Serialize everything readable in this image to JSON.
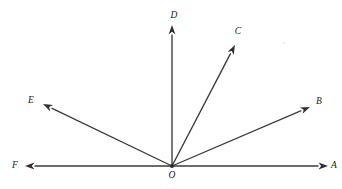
{
  "figure": {
    "background_color": "#ffffff",
    "line_color": "#3a3a3a",
    "arrow_color": "#2e2e2e",
    "label_color": "#1a1a1a",
    "width": 342,
    "height": 189
  },
  "vertex": {
    "label": "O",
    "x": 172,
    "y": 166,
    "label_x": 172,
    "label_y": 178
  },
  "rays": [
    {
      "label": "A",
      "name": "ray-oa",
      "from_x": 172,
      "from_y": 166,
      "to_x": 328,
      "to_y": 166,
      "angle_deg": 0,
      "label_x": 334,
      "label_y": 168
    },
    {
      "label": "B",
      "name": "ray-ob",
      "from_x": 172,
      "from_y": 166,
      "to_x": 310,
      "to_y": 107,
      "angle_deg": 23,
      "label_x": 319,
      "label_y": 104
    },
    {
      "label": "C",
      "name": "ray-oc",
      "from_x": 172,
      "from_y": 166,
      "to_x": 235,
      "to_y": 45,
      "angle_deg": 62,
      "label_x": 238,
      "label_y": 34
    },
    {
      "label": "D",
      "name": "ray-od",
      "from_x": 172,
      "from_y": 166,
      "to_x": 172,
      "to_y": 25,
      "angle_deg": 90,
      "label_x": 174,
      "label_y": 18
    },
    {
      "label": "E",
      "name": "ray-oe",
      "from_x": 172,
      "from_y": 166,
      "to_x": 43,
      "to_y": 104,
      "angle_deg": 154,
      "label_x": 31,
      "label_y": 103
    },
    {
      "label": "F",
      "name": "ray-of",
      "from_x": 172,
      "from_y": 166,
      "to_x": 25,
      "to_y": 166,
      "angle_deg": 180,
      "label_x": 15,
      "label_y": 168
    }
  ]
}
